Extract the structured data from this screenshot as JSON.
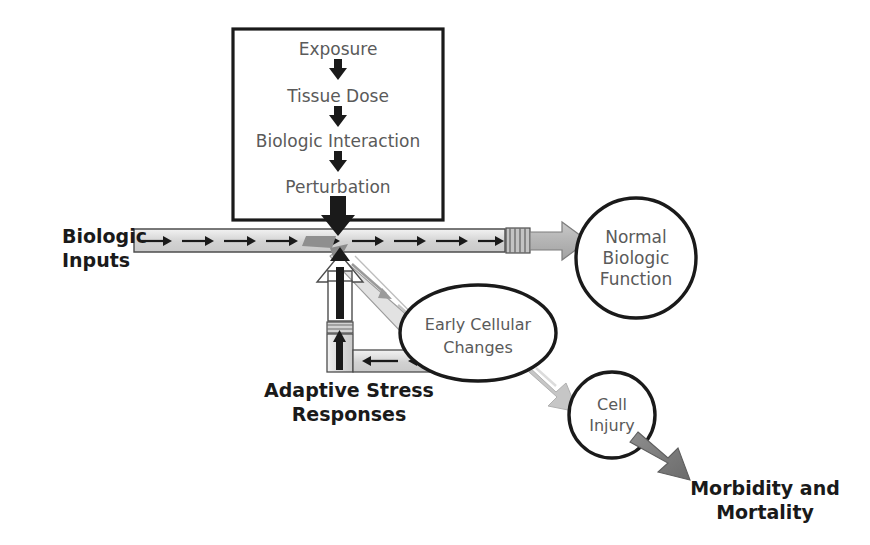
{
  "diagram": {
    "colors": {
      "ink": "#1a1a1a",
      "gray_text": "#5a5a5a",
      "band_fill": "#d9d9d9",
      "band_light": "#e8e8e8",
      "arrow_gray": "#b0b0b0",
      "arrow_gray_dark": "#808080",
      "arrow_gray_darker": "#6e6e6e",
      "white": "#ffffff"
    },
    "process_box": {
      "name": "exposure-cascade-box",
      "steps": [
        {
          "label": "Exposure"
        },
        {
          "label": "Tissue Dose"
        },
        {
          "label": "Biologic Interaction"
        },
        {
          "label": "Perturbation"
        }
      ],
      "connector_icon": "down-arrow-icon",
      "exit_icon": "thick-down-arrow-icon"
    },
    "labels": {
      "biologic_inputs": "Biologic\nInputs",
      "biologic_inputs_line1": "Biologic",
      "biologic_inputs_line2": "Inputs",
      "adaptive_stress_line1": "Adaptive Stress",
      "adaptive_stress_line2": "Responses",
      "morbidity_line1": "Morbidity and",
      "morbidity_line2": "Mortality"
    },
    "nodes": [
      {
        "name": "normal-biologic-function-node",
        "shape": "circle",
        "lines": [
          "Normal",
          "Biologic",
          "Function"
        ],
        "cx": 636,
        "cy": 258,
        "r": 60
      },
      {
        "name": "early-cellular-changes-node",
        "shape": "ellipse",
        "lines": [
          "Early Cellular",
          "Changes"
        ],
        "cx": 478,
        "cy": 333,
        "rx": 78,
        "ry": 48
      },
      {
        "name": "cell-injury-node",
        "shape": "circle",
        "lines": [
          "Cell",
          "Injury"
        ],
        "cx": 612,
        "cy": 415,
        "r": 43
      }
    ],
    "flows": [
      {
        "name": "biologic-inputs-band",
        "from": "Biologic Inputs",
        "to": "continuum",
        "style": "light-gray band with black arrows"
      },
      {
        "name": "normal-function-arrow",
        "from": "continuum",
        "to": "Normal Biologic Function",
        "style": "gray block arrow"
      },
      {
        "name": "perturbation-down-arrow",
        "from": "Perturbation",
        "to": "continuum",
        "style": "thick black arrow"
      },
      {
        "name": "early-changes-diagonal",
        "from": "continuum",
        "to": "Early Cellular Changes",
        "style": "gray diagonal band"
      },
      {
        "name": "adaptive-feedback-arrow",
        "from": "Adaptive Stress Responses",
        "to": "continuum",
        "style": "white block up arrow"
      },
      {
        "name": "adaptive-return-band",
        "from": "Early Cellular Changes",
        "to": "Adaptive Stress Responses",
        "style": "gray band with left arrows"
      },
      {
        "name": "cell-injury-arrow",
        "from": "Early Cellular Changes",
        "to": "Cell Injury",
        "style": "light gray block arrow"
      },
      {
        "name": "morbidity-arrow",
        "from": "Cell Injury",
        "to": "Morbidity and Mortality",
        "style": "dark gray block arrow"
      }
    ]
  }
}
